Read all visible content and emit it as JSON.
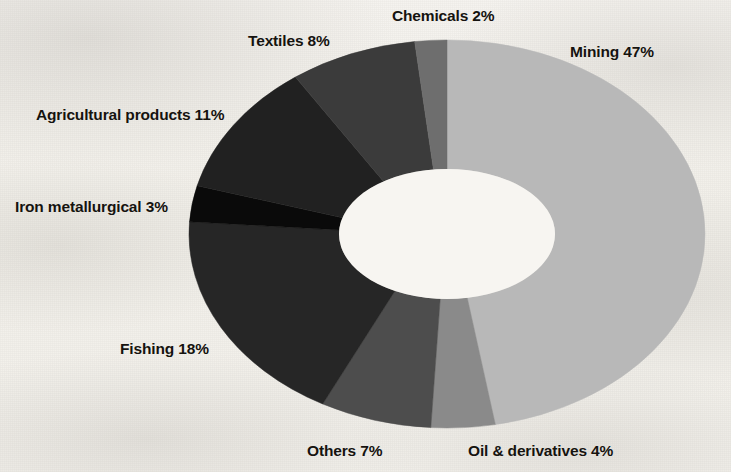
{
  "chart_data": {
    "type": "pie",
    "variant": "donut",
    "title": "",
    "subtitle": "",
    "xlabel": "",
    "ylabel": "",
    "legend_position": "none",
    "labels_inline": true,
    "units": "percent",
    "total": 100,
    "categories": [
      "Mining",
      "Oil & derivatives",
      "Others",
      "Fishing",
      "Iron metallurgical",
      "Agricultural products",
      "Textiles",
      "Chemicals"
    ],
    "values": [
      47,
      4,
      7,
      18,
      3,
      11,
      8,
      2
    ],
    "slices": [
      {
        "name": "Mining",
        "value": 47,
        "label": "Mining 47%",
        "color": "#b8b8b8",
        "start_angle": 0,
        "end_angle": 169.2,
        "label_x": 570,
        "label_y": 44
      },
      {
        "name": "Oil & derivatives",
        "value": 4,
        "label": "Oil & derivatives 4%",
        "color": "#8a8a8a",
        "start_angle": 169.2,
        "end_angle": 183.6,
        "label_x": 468,
        "label_y": 443
      },
      {
        "name": "Others",
        "value": 7,
        "label": "Others 7%",
        "color": "#4d4d4d",
        "start_angle": 183.6,
        "end_angle": 208.8,
        "label_x": 307,
        "label_y": 443
      },
      {
        "name": "Fishing",
        "value": 18,
        "label": "Fishing 18%",
        "color": "#262626",
        "start_angle": 208.8,
        "end_angle": 273.6,
        "label_x": 120,
        "label_y": 341
      },
      {
        "name": "Iron metallurgical",
        "value": 3,
        "label": "Iron metallurgical 3%",
        "color": "#0a0a0a",
        "start_angle": 273.6,
        "end_angle": 284.4,
        "label_x": 15,
        "label_y": 199
      },
      {
        "name": "Agricultural products",
        "value": 11,
        "label": "Agricultural products 11%",
        "color": "#212121",
        "start_angle": 284.4,
        "end_angle": 324,
        "label_x": 36,
        "label_y": 107
      },
      {
        "name": "Textiles",
        "value": 8,
        "label": "Textiles 8%",
        "color": "#3b3b3b",
        "start_angle": 324,
        "end_angle": 352.8,
        "label_x": 248,
        "label_y": 33
      },
      {
        "name": "Chemicals",
        "value": 2,
        "label": "Chemicals 2%",
        "color": "#6e6e6e",
        "start_angle": 352.8,
        "end_angle": 360,
        "label_x": 392,
        "label_y": 8
      }
    ],
    "geometry": {
      "center_x": 447,
      "center_y": 234,
      "outer_rx": 258,
      "outer_ry": 194,
      "inner_rx": 108,
      "inner_ry": 65,
      "rotation_deg": 0,
      "direction": "clockwise",
      "start_at": "12-oclock"
    },
    "colors": {
      "background": "#f3f1ed",
      "label_text": "#15130f",
      "hole": "#f7f5f1"
    }
  }
}
